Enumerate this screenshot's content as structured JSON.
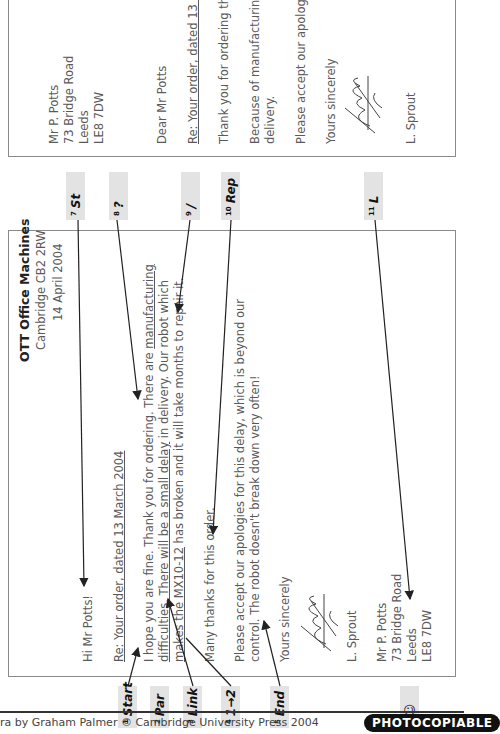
{
  "letter1": {
    "company": "OTT Office Machines",
    "company_address": "Cambridge CB2 2RW",
    "date": "14 April 2004",
    "greeting": "Hi Mr Potts!",
    "subject": "Re: Your order, dated 13 March 2004",
    "para1_line1_a": "I hope you are fine. Thank you for ordering. There are ",
    "para1_line1_b": "manufacturing",
    "para1_line2_a": "difficulties. There will be a small delay",
    "para1_line2_b": " in delivery. Our robot which",
    "para1_line3_a": "makes the MX10-12",
    "para1_line3_b": " has broken and it will take months to repair it.",
    "para2": "Many thanks for this order.",
    "para3_line1": "Please accept our apologies for this delay, which is beyond our",
    "para3_line2": "control. The robot doesn't break down very often!",
    "closing": "Yours sincerely",
    "signer": "L. Sprout",
    "recipient": [
      "Mr P. Potts",
      "73 Bridge Road",
      "Leeds",
      "LE8 7DW"
    ]
  },
  "letter2": {
    "recipient": [
      "Mr P. Potts",
      "73 Bridge Road",
      "Leeds",
      "LE8 7DW"
    ],
    "greeting": "Dear Mr Potts",
    "subject": "Re: Your order, dated 13 M",
    "para1": "Thank you for ordering the",
    "para2_line1": "Because of manufacturing",
    "para2_line2": "delivery.",
    "para3": "Please accept our apologie",
    "closing": "Yours sincerely",
    "signer": "L. Sprout"
  },
  "tags": [
    {
      "num": "1",
      "label": "Start"
    },
    {
      "num": "2",
      "label": "Par"
    },
    {
      "num": "3",
      "label": "Link"
    },
    {
      "num": "4",
      "label": "1→2"
    },
    {
      "num": "5",
      "label": "End"
    },
    {
      "num": "6",
      "label": "☺"
    },
    {
      "num": "7",
      "label": "St"
    },
    {
      "num": "8",
      "label": "?"
    },
    {
      "num": "9",
      "label": "/"
    },
    {
      "num": "10",
      "label": "Rep"
    },
    {
      "num": "11",
      "label": "L"
    }
  ],
  "footer": {
    "credit": "ra by Graham Palmer © Cambridge University Press 2004",
    "badge": "PHOTOCOPIABLE"
  }
}
